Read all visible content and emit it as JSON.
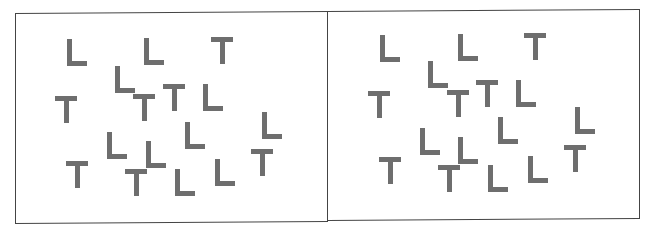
{
  "figure": {
    "letter_color": "#6e6e6e",
    "frame_color": "#444444",
    "panels": [
      {
        "id": "left",
        "items": [
          {
            "letter": "L",
            "x": 67,
            "y": 39
          },
          {
            "letter": "L",
            "x": 144,
            "y": 38
          },
          {
            "letter": "T",
            "x": 211,
            "y": 37
          },
          {
            "letter": "L",
            "x": 115,
            "y": 66
          },
          {
            "letter": "T",
            "x": 163,
            "y": 84
          },
          {
            "letter": "L",
            "x": 203,
            "y": 84
          },
          {
            "letter": "T",
            "x": 55,
            "y": 96
          },
          {
            "letter": "T",
            "x": 133,
            "y": 94
          },
          {
            "letter": "L",
            "x": 262,
            "y": 112
          },
          {
            "letter": "L",
            "x": 185,
            "y": 122
          },
          {
            "letter": "L",
            "x": 107,
            "y": 132
          },
          {
            "letter": "L",
            "x": 146,
            "y": 141
          },
          {
            "letter": "T",
            "x": 251,
            "y": 149
          },
          {
            "letter": "T",
            "x": 66,
            "y": 161
          },
          {
            "letter": "T",
            "x": 125,
            "y": 169
          },
          {
            "letter": "L",
            "x": 215,
            "y": 159
          },
          {
            "letter": "L",
            "x": 175,
            "y": 169
          }
        ]
      },
      {
        "id": "right",
        "items": [
          {
            "letter": "L",
            "x": 380,
            "y": 35
          },
          {
            "letter": "L",
            "x": 458,
            "y": 34
          },
          {
            "letter": "T",
            "x": 524,
            "y": 33
          },
          {
            "letter": "L",
            "x": 428,
            "y": 61
          },
          {
            "letter": "T",
            "x": 476,
            "y": 80
          },
          {
            "letter": "L",
            "x": 516,
            "y": 80
          },
          {
            "letter": "T",
            "x": 368,
            "y": 91
          },
          {
            "letter": "T",
            "x": 447,
            "y": 90
          },
          {
            "letter": "L",
            "x": 575,
            "y": 107
          },
          {
            "letter": "L",
            "x": 498,
            "y": 117
          },
          {
            "letter": "L",
            "x": 420,
            "y": 128
          },
          {
            "letter": "L",
            "x": 458,
            "y": 137
          },
          {
            "letter": "T",
            "x": 564,
            "y": 145
          },
          {
            "letter": "T",
            "x": 379,
            "y": 157
          },
          {
            "letter": "T",
            "x": 438,
            "y": 165
          },
          {
            "letter": "L",
            "x": 528,
            "y": 156
          },
          {
            "letter": "L",
            "x": 488,
            "y": 165
          }
        ]
      }
    ]
  }
}
